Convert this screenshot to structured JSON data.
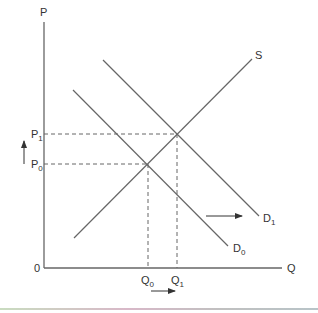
{
  "diagram": {
    "type": "supply-demand shift",
    "axes": {
      "y_label": "P",
      "x_label": "Q",
      "origin_label": "0"
    },
    "curves": [
      {
        "id": "S",
        "label": "S",
        "kind": "supply"
      },
      {
        "id": "D0",
        "label": "D",
        "subscript": "0",
        "kind": "demand"
      },
      {
        "id": "D1",
        "label": "D",
        "subscript": "1",
        "kind": "demand"
      }
    ],
    "price_levels": [
      {
        "label": "P",
        "subscript": "1"
      },
      {
        "label": "P",
        "subscript": "0"
      }
    ],
    "quantity_levels": [
      {
        "label": "Q",
        "subscript": "0"
      },
      {
        "label": "Q",
        "subscript": "1"
      }
    ],
    "arrows": [
      {
        "name": "price-increase-arrow",
        "direction": "up"
      },
      {
        "name": "demand-shift-arrow",
        "direction": "right"
      },
      {
        "name": "quantity-increase-arrow",
        "direction": "right"
      }
    ],
    "colors": {
      "line": "#666666",
      "text": "#333333"
    }
  }
}
